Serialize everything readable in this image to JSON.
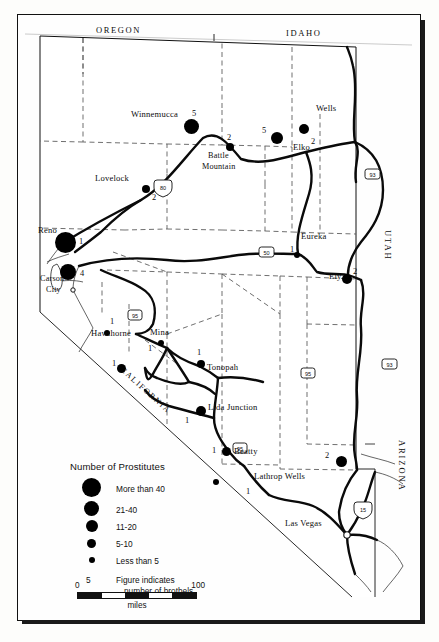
{
  "figure": {
    "scale": {
      "start_label": "0",
      "end_label": "100",
      "units": "miles",
      "segments": 5
    }
  },
  "legend": {
    "title": "Number of Prostitutes",
    "classes": [
      {
        "size_px": 17,
        "label": "More than 40"
      },
      {
        "size_px": 13,
        "label": "21-40"
      },
      {
        "size_px": 10,
        "label": "11-20"
      },
      {
        "size_px": 7.5,
        "label": "5-10"
      },
      {
        "size_px": 5,
        "label": "Less than 5"
      }
    ],
    "figure_note": {
      "sample_number": "5",
      "line1": "Figure indicates",
      "line2": "number of brothels"
    }
  },
  "neighbor_states": [
    {
      "name": "OREGON",
      "position": "top-left"
    },
    {
      "name": "IDAHO",
      "position": "top-right"
    },
    {
      "name": "UTAH",
      "position": "right-upper"
    },
    {
      "name": "ARIZONA",
      "position": "right-lower"
    },
    {
      "name": "CALIFORNIA",
      "position": "southwest-diagonal"
    }
  ],
  "cities": [
    {
      "name": "Winnemucca",
      "brothels": "5",
      "dot_px": 13,
      "x": 186,
      "y": 122
    },
    {
      "name": "Battle Mountain",
      "brothels": "2",
      "dot_px": 8,
      "x": 224,
      "y": 144,
      "two_line": true
    },
    {
      "name": "Wells",
      "brothels": "2",
      "dot_px": 9,
      "x": 338,
      "y": 129
    },
    {
      "name": "Elko",
      "brothels": "5",
      "dot_px": 11,
      "x": 290,
      "y": 137
    },
    {
      "name": "Lovelock",
      "brothels": "2",
      "dot_px": 7.5,
      "x": 131,
      "y": 189
    },
    {
      "name": "Reno",
      "brothels": "1",
      "dot_px": 17,
      "x": 65,
      "y": 245
    },
    {
      "name": "Carson City",
      "brothels": "4",
      "dot_px": 13,
      "x": 71,
      "y": 273,
      "two_line": true
    },
    {
      "name": "Eureka",
      "brothels": "1",
      "dot_px": 6,
      "x": 281,
      "y": 240
    },
    {
      "name": "Ely",
      "brothels": "2",
      "dot_px": 9,
      "x": 344,
      "y": 266
    },
    {
      "name": "Hawthorne",
      "brothels": "1",
      "dot_px": 6,
      "x": 119,
      "y": 320
    },
    {
      "name": "Mina",
      "brothels": "1",
      "dot_px": 6,
      "x": 150,
      "y": 334
    },
    {
      "name": "Tonopah",
      "brothels": "1",
      "dot_px": 8,
      "x": 201,
      "y": 364
    },
    {
      "name": "Lida Junction",
      "brothels": "1",
      "dot_px": 9,
      "x": 197,
      "y": 404
    },
    {
      "name": "Beatty",
      "brothels": "1",
      "dot_px": 8,
      "x": 227,
      "y": 452
    },
    {
      "name": "Lathrop Wells",
      "brothels": "1",
      "dot_px": 5.5,
      "x": 252,
      "y": 481
    },
    {
      "name": "Las Vegas",
      "brothels": "",
      "dot_px": 0,
      "x": 330,
      "y": 521
    },
    {
      "name": "",
      "brothels": "2",
      "dot_px": 10,
      "x": 340,
      "y": 456
    },
    {
      "name": "",
      "brothels": "1",
      "dot_px": 7.5,
      "x": 128,
      "y": 354
    }
  ],
  "highways": [
    {
      "shield": "interstate",
      "number": "80",
      "x": 146,
      "y": 173
    },
    {
      "shield": "interstate",
      "number": "80",
      "x": 249,
      "y": 238
    },
    {
      "shield": "us",
      "number": "93",
      "x": 355,
      "y": 160
    },
    {
      "shield": "us",
      "number": "93",
      "x": 372,
      "y": 350
    },
    {
      "shield": "us",
      "number": "95",
      "x": 118,
      "y": 301
    },
    {
      "shield": "us",
      "number": "95",
      "x": 223,
      "y": 434
    },
    {
      "shield": "us",
      "number": "95",
      "x": 291,
      "y": 359
    },
    {
      "shield": "interstate",
      "number": "15",
      "x": 346,
      "y": 495
    }
  ]
}
